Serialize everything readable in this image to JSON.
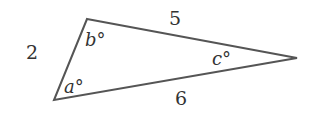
{
  "diagram": {
    "type": "triangle",
    "stroke_color": "#555555",
    "text_color": "#333333",
    "vertices": {
      "top": {
        "x": 87,
        "y": 19
      },
      "bottom_left": {
        "x": 54,
        "y": 100
      },
      "right": {
        "x": 297,
        "y": 58
      }
    },
    "sides": {
      "left": "2",
      "top": "5",
      "bottom": "6"
    },
    "angles": {
      "bottom_left": "a°",
      "top": "b°",
      "right": "c°"
    }
  }
}
